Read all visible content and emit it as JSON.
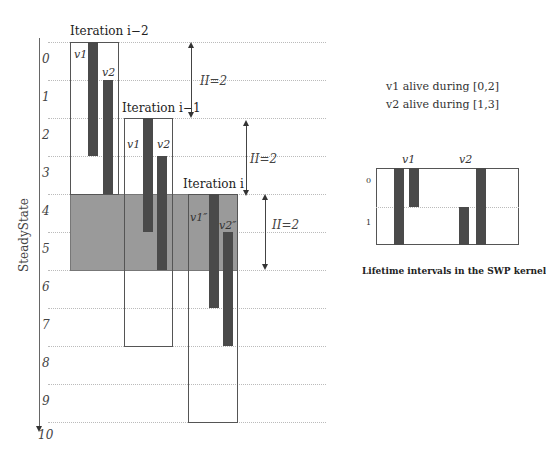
{
  "diagram": {
    "steady_state_label": "SteadyState",
    "rows": [
      "0",
      "1",
      "2",
      "3",
      "4",
      "5",
      "6",
      "7",
      "8",
      "9"
    ],
    "axis_end_label": "10",
    "iterations": [
      {
        "label": "Iteration i−2",
        "start_row": 0,
        "v1_label": "v1",
        "v2_label": "v2",
        "v1_interval": [
          0,
          3
        ],
        "v2_interval": [
          1,
          4
        ]
      },
      {
        "label": "Iteration i−1",
        "start_row": 2,
        "v1_label": "v1",
        "v2_label": "v2",
        "v1_interval": [
          2,
          5
        ],
        "v2_interval": [
          3,
          6
        ]
      },
      {
        "label": "Iteration i",
        "start_row": 4,
        "v1_label": "v1″",
        "v2_label": "v2″",
        "v1_interval": [
          4,
          7
        ],
        "v2_interval": [
          5,
          8
        ]
      }
    ],
    "ii_labels": [
      "II=2",
      "II=2",
      "II=2"
    ],
    "steady_state_rows": [
      4,
      6
    ],
    "colors": {
      "bar": "#4a4a4a",
      "shade": "#9a9a9a",
      "grid": "#bbbbbb"
    }
  },
  "info": {
    "v1_text": "v1 alive during [0,2]",
    "v2_text": "v2 alive during [1,3]"
  },
  "kernel": {
    "rows": [
      "0",
      "1"
    ],
    "v1_label": "v1",
    "v2_label": "v2",
    "caption": "Lifetime intervals in the SWP kernel"
  }
}
